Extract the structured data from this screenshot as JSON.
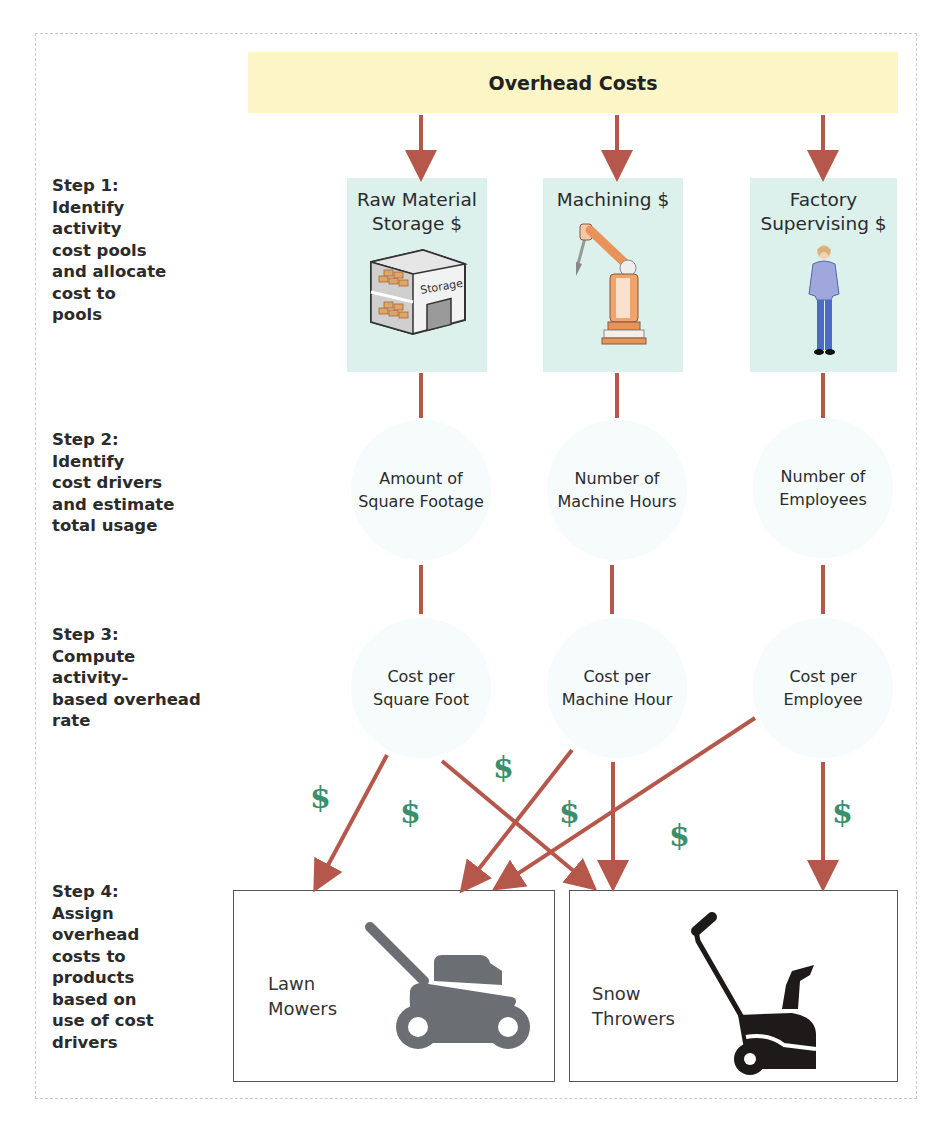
{
  "header": {
    "title": "Overhead Costs"
  },
  "steps": [
    {
      "id": "step-1",
      "label": "Step 1:\nIdentify\nactivity\ncost pools\nand allocate\ncost to\npools"
    },
    {
      "id": "step-2",
      "label": "Step 2:\nIdentify\ncost drivers\nand estimate\ntotal usage"
    },
    {
      "id": "step-3",
      "label": "Step 3:\nCompute\nactivity-\nbased overhead\nrate"
    },
    {
      "id": "step-4",
      "label": "Step 4:\nAssign\noverhead\ncosts to\nproducts\nbased on\nuse of cost\ndrivers"
    }
  ],
  "cost_pools": [
    {
      "title": "Raw Material\nStorage $",
      "icon": "storage-building-icon",
      "icon_text": "Storage"
    },
    {
      "title": "Machining $",
      "icon": "robotic-arm-icon"
    },
    {
      "title": "Factory\nSupervising $",
      "icon": "supervisor-person-icon"
    }
  ],
  "cost_drivers": [
    {
      "label": "Amount of\nSquare Footage"
    },
    {
      "label": "Number of\nMachine Hours"
    },
    {
      "label": "Number of\nEmployees"
    }
  ],
  "rates": [
    {
      "label": "Cost per\nSquare Foot"
    },
    {
      "label": "Cost per\nMachine Hour"
    },
    {
      "label": "Cost per\nEmployee"
    }
  ],
  "products": [
    {
      "label": "Lawn\nMowers",
      "icon": "lawn-mower-icon",
      "icon_color": "#6b6e73"
    },
    {
      "label": "Snow\nThrowers",
      "icon": "snow-thrower-icon",
      "icon_color": "#1f1a1a"
    }
  ],
  "dollar_signs": [
    "$",
    "$",
    "$",
    "$",
    "$",
    "$",
    "$"
  ],
  "colors": {
    "top_band": "#fcf6c6",
    "pool_card": "#dcf0ec",
    "arrow": "#b5574a",
    "dollar": "#3a8f6c",
    "circle": "#f6fbfb"
  }
}
